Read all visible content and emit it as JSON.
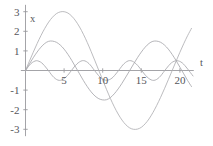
{
  "chart_data": {
    "type": "line",
    "title": "",
    "subtitle": "",
    "xlabel": "t",
    "ylabel": "x",
    "xlim": [
      -0.6,
      21.8
    ],
    "ylim": [
      -3.35,
      3.35
    ],
    "grid": false,
    "legend": null,
    "x_ticks": [
      5,
      10,
      15,
      20
    ],
    "x_tick_labels": [
      "5",
      "10",
      "15",
      "20"
    ],
    "y_ticks": [
      -3,
      -2,
      -1,
      1,
      2,
      3
    ],
    "y_tick_labels": [
      "-3",
      "-2",
      "-1",
      "1",
      "2",
      "3"
    ],
    "series": [
      {
        "name": "large-amplitude-beat",
        "color": "#b0b0b4",
        "amplitude": 3,
        "description": "beat envelope, peak +3 near t=5, trough -3 near t=13.5, rising to +3 near t=21",
        "x": [
          0,
          0.5,
          1,
          1.5,
          2,
          2.5,
          3,
          3.5,
          4,
          4.5,
          5,
          5.5,
          6,
          6.5,
          7,
          7.5,
          8,
          8.5,
          9,
          9.5,
          10,
          10.5,
          11,
          11.5,
          12,
          12.5,
          13,
          13.5,
          14,
          14.5,
          15,
          15.5,
          16,
          16.5,
          17,
          17.5,
          18,
          18.5,
          19,
          19.5,
          20,
          20.5,
          21,
          21.5
        ],
        "y": [
          0,
          0.47,
          0.93,
          1.37,
          1.78,
          2.15,
          2.47,
          2.72,
          2.9,
          2.99,
          3.0,
          2.93,
          2.77,
          2.53,
          2.22,
          1.85,
          1.43,
          0.97,
          0.49,
          0.0,
          -0.49,
          -0.97,
          -1.43,
          -1.85,
          -2.22,
          -2.53,
          -2.77,
          -2.93,
          -3.0,
          -2.99,
          -2.9,
          -2.72,
          -2.47,
          -2.15,
          -1.78,
          -1.37,
          -0.93,
          -0.47,
          0.0,
          0.47,
          0.93,
          1.37,
          1.78,
          2.15
        ]
      },
      {
        "name": "medium-amplitude-oscillation",
        "color": "#a8a8ac",
        "amplitude": 1.5,
        "description": "amplitude 1.5, period about 7, peaks near t=3, t=10, t=17",
        "x": [
          0,
          0.5,
          1,
          1.5,
          2,
          2.5,
          3,
          3.5,
          4,
          4.5,
          5,
          5.5,
          6,
          6.5,
          7,
          7.5,
          8,
          8.5,
          9,
          9.5,
          10,
          10.5,
          11,
          11.5,
          12,
          12.5,
          13,
          13.5,
          14,
          14.5,
          15,
          15.5,
          16,
          16.5,
          17,
          17.5,
          18,
          18.5,
          19,
          19.5,
          20,
          20.5,
          21,
          21.5
        ],
        "y": [
          0,
          0.33,
          0.65,
          0.94,
          1.19,
          1.38,
          1.49,
          1.5,
          1.44,
          1.3,
          1.09,
          0.82,
          0.51,
          0.17,
          -0.17,
          -0.51,
          -0.82,
          -1.09,
          -1.3,
          -1.44,
          -1.5,
          -1.49,
          -1.38,
          -1.19,
          -0.94,
          -0.65,
          -0.33,
          0.0,
          0.33,
          0.65,
          0.94,
          1.19,
          1.38,
          1.49,
          1.5,
          1.44,
          1.3,
          1.09,
          0.82,
          0.51,
          0.17,
          -0.17,
          -0.51,
          -0.82
        ]
      },
      {
        "name": "small-amplitude-oscillation",
        "color": "#a8a8ac",
        "amplitude": 0.5,
        "description": "amplitude 0.5, fast oscillation, period about 5.6",
        "x": [
          0,
          0.35,
          0.7,
          1.05,
          1.4,
          1.75,
          2.1,
          2.45,
          2.8,
          3.15,
          3.5,
          3.85,
          4.2,
          4.55,
          4.9,
          5.25,
          5.6,
          5.95,
          6.3,
          6.65,
          7,
          7.35,
          7.7,
          8.05,
          8.4,
          8.75,
          9.1,
          9.45,
          9.8,
          10.15,
          10.5,
          10.85,
          11.2,
          11.55,
          11.9,
          12.25,
          12.6,
          12.95,
          13.3,
          13.65,
          14,
          14.35,
          14.7,
          15.05,
          15.4,
          15.75,
          16.1,
          16.45,
          16.8,
          17.15,
          17.5,
          17.85,
          18.2,
          18.55,
          18.9,
          19.25,
          19.6,
          19.95,
          20.3,
          20.65,
          21,
          21.35,
          21.7
        ],
        "y": [
          0,
          0.19,
          0.35,
          0.45,
          0.5,
          0.47,
          0.39,
          0.25,
          0.08,
          -0.1,
          -0.28,
          -0.41,
          -0.49,
          -0.5,
          -0.44,
          -0.33,
          -0.18,
          0.0,
          0.18,
          0.33,
          0.44,
          0.5,
          0.49,
          0.41,
          0.28,
          0.1,
          -0.08,
          -0.25,
          -0.39,
          -0.47,
          -0.5,
          -0.47,
          -0.39,
          -0.25,
          -0.08,
          0.1,
          0.28,
          0.41,
          0.49,
          0.5,
          0.44,
          0.33,
          0.18,
          0.0,
          -0.18,
          -0.33,
          -0.44,
          -0.5,
          -0.49,
          -0.41,
          -0.28,
          -0.1,
          0.08,
          0.25,
          0.39,
          0.47,
          0.5,
          0.47,
          0.39,
          0.25,
          0.08,
          -0.1,
          -0.28
        ]
      }
    ],
    "colors": {
      "axis": "#9a9a9e",
      "label": "#55565a",
      "background": "#ffffff"
    }
  }
}
